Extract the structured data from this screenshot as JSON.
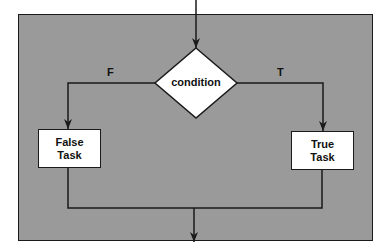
{
  "diagram": {
    "type": "flowchart-if-else",
    "decision": {
      "label": "condition"
    },
    "branches": [
      {
        "label": "F",
        "task": "False\nTask"
      },
      {
        "label": "T",
        "task": "True\nTask"
      }
    ],
    "colors": {
      "background": "#9a9a9a",
      "shape_fill": "#ffffff",
      "stroke": "#1a1a1a"
    }
  }
}
